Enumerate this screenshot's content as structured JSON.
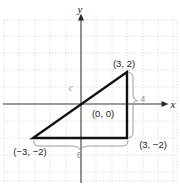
{
  "figure": {
    "colors": {
      "background": "#ffffff",
      "grid": "#c6c6c6",
      "axis": "#3a3a3a",
      "triangle": "#111111",
      "brace": "#9b9b9b",
      "coordinate_label": "#1a1a1a",
      "measure_label": "#8e8e8e"
    },
    "labels": {
      "y_axis": "y",
      "x_axis": "x",
      "vertex_top_right": "(3, 2)",
      "origin": "(0, 0)",
      "vertex_bottom_left": "(−3, −2)",
      "vertex_bottom_right": "(3, −2)",
      "hypotenuse": "c",
      "vertical_leg_length": "4",
      "horizontal_leg_length": "6"
    },
    "geometry": {
      "triangle_vertices": [
        [
          -3,
          -2
        ],
        [
          3,
          -2
        ],
        [
          3,
          2
        ]
      ],
      "hypotenuse_through_point": [
        0,
        0
      ],
      "horizontal_leg_units": 6,
      "vertical_leg_units": 4
    }
  }
}
